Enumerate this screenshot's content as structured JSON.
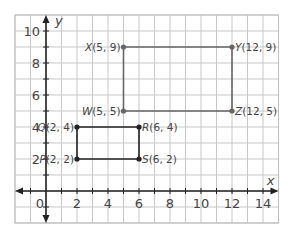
{
  "chart_data": {
    "type": "scatter",
    "title": "",
    "xlabel": "x",
    "ylabel": "y",
    "xlim": [
      -2,
      15
    ],
    "ylim": [
      -2,
      11
    ],
    "grid": true,
    "x_ticks": [
      0,
      2,
      4,
      6,
      8,
      10,
      12,
      14
    ],
    "y_ticks": [
      2,
      4,
      6,
      8,
      10
    ],
    "x_tick_labels": [
      "0",
      "2",
      "4",
      "6",
      "8",
      "10",
      "12",
      "14"
    ],
    "y_tick_labels": [
      "2",
      "4",
      "6",
      "8",
      "10"
    ],
    "origin_label": "0",
    "rectangles": [
      {
        "name": "PQRS",
        "color": "#222222",
        "points": [
          {
            "name": "P",
            "x": 2,
            "y": 2,
            "label": "P(2, 2)",
            "label_side": "left"
          },
          {
            "name": "Q",
            "x": 2,
            "y": 4,
            "label": "Q(2, 4)",
            "label_side": "left"
          },
          {
            "name": "R",
            "x": 6,
            "y": 4,
            "label": "R(6, 4)",
            "label_side": "right"
          },
          {
            "name": "S",
            "x": 6,
            "y": 2,
            "label": "S(6, 2)",
            "label_side": "right"
          }
        ]
      },
      {
        "name": "WXYZ",
        "color": "#666666",
        "points": [
          {
            "name": "W",
            "x": 5,
            "y": 5,
            "label": "W(5, 5)",
            "label_side": "left"
          },
          {
            "name": "X",
            "x": 5,
            "y": 9,
            "label": "X(5, 9)",
            "label_side": "left"
          },
          {
            "name": "Y",
            "x": 12,
            "y": 9,
            "label": "Y(12, 9)",
            "label_side": "right"
          },
          {
            "name": "Z",
            "x": 12,
            "y": 5,
            "label": "Z(12, 5)",
            "label_side": "right"
          }
        ]
      }
    ]
  },
  "layout": {
    "origin_px": [
      46,
      191
    ],
    "unit_x_px": 15.5,
    "unit_y_px": 16,
    "grid_color": "#c8c8c8",
    "axis_color": "#222222"
  }
}
